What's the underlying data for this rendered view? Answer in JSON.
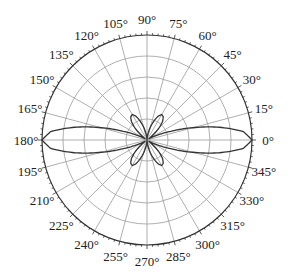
{
  "chart_data": {
    "type": "polar",
    "title": "",
    "center": [
      147,
      140
    ],
    "radius_px": 105,
    "rings": [
      0.2,
      0.4,
      0.6,
      0.8,
      1.0
    ],
    "angular_grid_step_deg": 15,
    "angle_tick_labels": [
      "0°",
      "15°",
      "30°",
      "45°",
      "60°",
      "75°",
      "90°",
      "105°",
      "120°",
      "135°",
      "150°",
      "165°",
      "180°",
      "195°",
      "210°",
      "225°",
      "240°",
      "255°",
      "270°",
      "285°",
      "300°",
      "315°",
      "330°",
      "345°"
    ],
    "grid": true,
    "legend": null,
    "series": [
      {
        "name": "radiation pattern",
        "symmetry": "four-fold (mirror about 0°-180° and 90°-270° axes)",
        "theta_deg_first_quadrant": [
          0,
          5,
          10,
          15,
          20,
          25,
          30,
          35,
          40,
          45,
          50,
          55,
          60,
          65,
          70,
          75,
          80,
          85,
          90
        ],
        "r_normalized": [
          1.0,
          0.92,
          0.7,
          0.45,
          0.24,
          0.11,
          0.04,
          0.02,
          0.08,
          0.16,
          0.23,
          0.27,
          0.28,
          0.25,
          0.19,
          0.13,
          0.07,
          0.03,
          0.0
        ]
      }
    ],
    "colors": {
      "grid": "#9a9a9a",
      "curve": "#333333",
      "outer": "#333333",
      "text": "#222222"
    }
  }
}
